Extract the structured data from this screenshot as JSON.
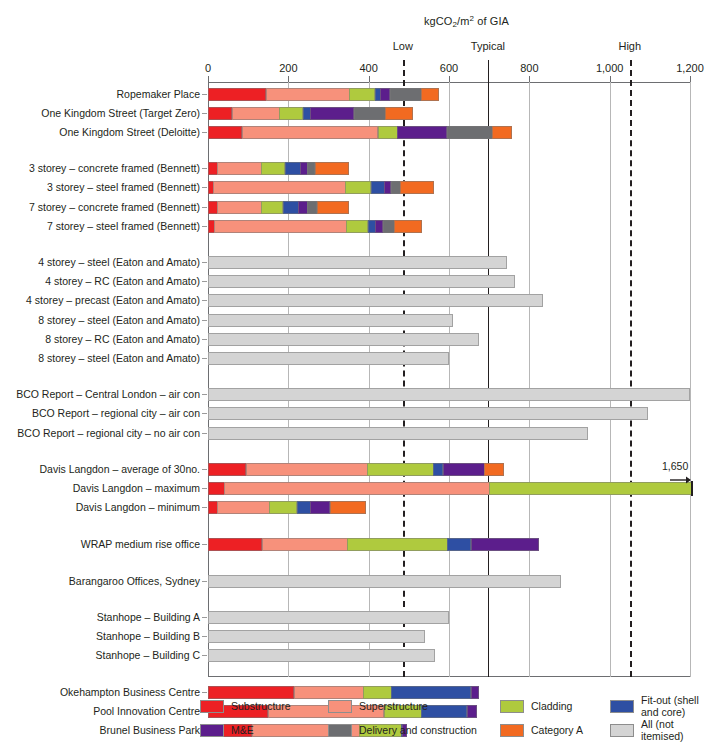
{
  "chart_data": {
    "type": "bar",
    "orientation": "horizontal",
    "stacked": true,
    "title": "kgCO2/m2 of GIA",
    "title_parts": {
      "pre": "kgCO",
      "sub": "2",
      "mid": "/m",
      "sup": "2",
      "post": " of GIA"
    },
    "xlabel": "kgCO2/m2 of GIA",
    "ylabel": "",
    "xlim": [
      0,
      1200
    ],
    "grid": true,
    "legend_position": "bottom",
    "tick_values": [
      0,
      200,
      400,
      600,
      800,
      1000,
      1200
    ],
    "tick_labels": [
      "0",
      "200",
      "400",
      "600",
      "800",
      "1,000",
      "1,200"
    ],
    "benchmarks": [
      {
        "label": "Low",
        "value": 485,
        "style": "dashed"
      },
      {
        "label": "Typical",
        "value": 697,
        "style": "solid"
      },
      {
        "label": "High",
        "value": 1050,
        "style": "dashed"
      }
    ],
    "series": [
      {
        "name": "Substructure",
        "key": "substructure",
        "color": "#ED2024"
      },
      {
        "name": "Superstructure",
        "key": "superstructure",
        "color": "#F7917B"
      },
      {
        "name": "Cladding",
        "key": "cladding",
        "color": "#AFCA3E"
      },
      {
        "name": "Fit-out (shell and core)",
        "key": "fitout",
        "color": "#2E4FA3"
      },
      {
        "name": "M&E",
        "key": "me",
        "color": "#5C1E8C"
      },
      {
        "name": "Delivery and construction",
        "key": "delivery",
        "color": "#6D6E71"
      },
      {
        "name": "Category A",
        "key": "categorya",
        "color": "#F26A21"
      },
      {
        "name": "All (not itemised)",
        "key": "all",
        "color": "#D4D4D4"
      }
    ],
    "groups": [
      {
        "rows": [
          {
            "label": "Ropemaker Place",
            "segments": [
              [
                "substructure",
                145
              ],
              [
                "superstructure",
                210
              ],
              [
                "cladding",
                65
              ],
              [
                "fitout",
                15
              ],
              [
                "me",
                25
              ],
              [
                "delivery",
                80
              ],
              [
                "categorya",
                45
              ]
            ]
          },
          {
            "label": "One Kingdom Street (Target Zero)",
            "segments": [
              [
                "substructure",
                60
              ],
              [
                "superstructure",
                120
              ],
              [
                "cladding",
                60
              ],
              [
                "fitout",
                20
              ],
              [
                "me",
                110
              ],
              [
                "delivery",
                80
              ],
              [
                "categorya",
                70
              ]
            ]
          },
          {
            "label": "One Kingdom Street (Deloitte)",
            "segments": [
              [
                "substructure",
                85
              ],
              [
                "superstructure",
                340
              ],
              [
                "cladding",
                50
              ],
              [
                "me",
                125
              ],
              [
                "delivery",
                115
              ],
              [
                "categorya",
                50
              ]
            ]
          }
        ]
      },
      {
        "rows": [
          {
            "label": "3 storey – concrete framed (Bennett)",
            "segments": [
              [
                "substructure",
                25
              ],
              [
                "superstructure",
                110
              ],
              [
                "cladding",
                60
              ],
              [
                "fitout",
                40
              ],
              [
                "me",
                20
              ],
              [
                "delivery",
                20
              ],
              [
                "categorya",
                85
              ]
            ]
          },
          {
            "label": "3 storey – steel framed (Bennett)",
            "segments": [
              [
                "substructure",
                15
              ],
              [
                "superstructure",
                330
              ],
              [
                "cladding",
                65
              ],
              [
                "fitout",
                35
              ],
              [
                "me",
                17
              ],
              [
                "delivery",
                25
              ],
              [
                "categorya",
                85
              ]
            ]
          },
          {
            "label": "7 storey – concrete framed (Bennett)",
            "segments": [
              [
                "substructure",
                25
              ],
              [
                "superstructure",
                110
              ],
              [
                "cladding",
                55
              ],
              [
                "fitout",
                40
              ],
              [
                "me",
                25
              ],
              [
                "delivery",
                25
              ],
              [
                "categorya",
                80
              ]
            ]
          },
          {
            "label": "7 storey – steel framed (Bennett)",
            "segments": [
              [
                "substructure",
                17
              ],
              [
                "superstructure",
                330
              ],
              [
                "cladding",
                55
              ],
              [
                "fitout",
                20
              ],
              [
                "me",
                20
              ],
              [
                "delivery",
                30
              ],
              [
                "categorya",
                70
              ]
            ]
          }
        ]
      },
      {
        "rows": [
          {
            "label": "4 storey – steel (Eaton and Amato)",
            "segments": [
              [
                "all",
                745
              ]
            ]
          },
          {
            "label": "4 storey – RC (Eaton and Amato)",
            "segments": [
              [
                "all",
                765
              ]
            ]
          },
          {
            "label": "4 storey – precast (Eaton and Amato)",
            "segments": [
              [
                "all",
                835
              ]
            ]
          },
          {
            "label": "8 storey – steel (Eaton and Amato)",
            "segments": [
              [
                "all",
                610
              ]
            ]
          },
          {
            "label": "8 storey – RC (Eaton and Amato)",
            "segments": [
              [
                "all",
                675
              ]
            ]
          },
          {
            "label": "8 storey – steel (Eaton and Amato)",
            "segments": [
              [
                "all",
                600
              ]
            ]
          }
        ]
      },
      {
        "rows": [
          {
            "label": "BCO Report – Central London – air con",
            "segments": [
              [
                "all",
                1200
              ]
            ]
          },
          {
            "label": "BCO Report – regional city – air con",
            "segments": [
              [
                "all",
                1095
              ]
            ]
          },
          {
            "label": "BCO Report – regional city – no air con",
            "segments": [
              [
                "all",
                945
              ]
            ]
          }
        ]
      },
      {
        "rows": [
          {
            "label": "Davis Langdon – average of 30no.",
            "segments": [
              [
                "substructure",
                95
              ],
              [
                "superstructure",
                305
              ],
              [
                "cladding",
                165
              ],
              [
                "fitout",
                25
              ],
              [
                "me",
                105
              ],
              [
                "categorya",
                50
              ]
            ]
          },
          {
            "label": "Davis Langdon – maximum",
            "segments": [
              [
                "substructure",
                55
              ],
              [
                "superstructure",
                905
              ],
              [
                "cladding",
                690
              ]
            ],
            "annotation": "1,650",
            "annotation_value": 1650
          },
          {
            "label": "Davis Langdon – minimum",
            "segments": [
              [
                "substructure",
                25
              ],
              [
                "superstructure",
                130
              ],
              [
                "cladding",
                70
              ],
              [
                "fitout",
                35
              ],
              [
                "me",
                50
              ],
              [
                "categorya",
                90
              ]
            ]
          }
        ]
      },
      {
        "rows": [
          {
            "label": "WRAP medium rise office",
            "segments": [
              [
                "substructure",
                135
              ],
              [
                "superstructure",
                215
              ],
              [
                "cladding",
                250
              ],
              [
                "fitout",
                60
              ],
              [
                "me",
                170
              ]
            ]
          }
        ]
      },
      {
        "rows": [
          {
            "label": "Barangaroo Offices, Sydney",
            "segments": [
              [
                "all",
                880
              ]
            ]
          }
        ]
      },
      {
        "rows": [
          {
            "label": "Stanhope – Building A",
            "segments": [
              [
                "all",
                600
              ]
            ]
          },
          {
            "label": "Stanhope – Building B",
            "segments": [
              [
                "all",
                540
              ]
            ]
          },
          {
            "label": "Stanhope – Building C",
            "segments": [
              [
                "all",
                565
              ]
            ]
          }
        ]
      },
      {
        "rows": [
          {
            "label": "Okehampton Business Centre",
            "segments": [
              [
                "substructure",
                215
              ],
              [
                "superstructure",
                175
              ],
              [
                "cladding",
                70
              ],
              [
                "fitout",
                200
              ],
              [
                "me",
                20
              ]
            ]
          },
          {
            "label": "Pool Innovation Centre",
            "segments": [
              [
                "substructure",
                150
              ],
              [
                "superstructure",
                290
              ],
              [
                "cladding",
                95
              ],
              [
                "fitout",
                115
              ],
              [
                "me",
                25
              ]
            ]
          },
          {
            "label": "Brunel Business Park",
            "segments": [
              [
                "substructure",
                110
              ],
              [
                "superstructure",
                270
              ],
              [
                "cladding",
                105
              ],
              [
                "fitout",
                5
              ],
              [
                "me",
                12
              ]
            ]
          }
        ]
      },
      {
        "rows": [
          {
            "label": "Leadenhall Building, London",
            "segments": [
              [
                "substructure",
                205
              ],
              [
                "superstructure",
                400
              ],
              [
                "cladding",
                100
              ],
              [
                "fitout",
                65
              ]
            ]
          }
        ]
      }
    ]
  },
  "legend": {
    "items": [
      {
        "label": "Substructure",
        "color": "#ED2024"
      },
      {
        "label": "Superstructure",
        "color": "#F7917B"
      },
      {
        "label": "Cladding",
        "color": "#AFCA3E"
      },
      {
        "label": "Fit-out (shell and core)",
        "color": "#2E4FA3"
      },
      {
        "label": "M&E",
        "color": "#5C1E8C"
      },
      {
        "label": "Delivery and construction",
        "color": "#6D6E71"
      },
      {
        "label": "Category A",
        "color": "#F26A21"
      },
      {
        "label": "All (not itemised)",
        "color": "#D4D4D4"
      }
    ]
  }
}
